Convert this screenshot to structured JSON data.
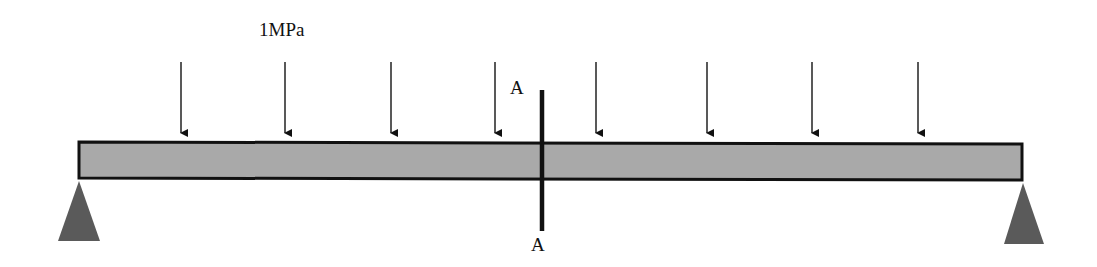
{
  "diagram": {
    "load_label": "1MPa",
    "section_label_top": "A",
    "section_label_bottom": "A",
    "arrow_x": [
      181,
      285,
      391,
      495,
      596,
      707,
      812,
      918
    ],
    "colors": {
      "beam_fill": "#a9a9a9",
      "support_fill": "#5a5a5a",
      "stroke": "#111111"
    }
  }
}
